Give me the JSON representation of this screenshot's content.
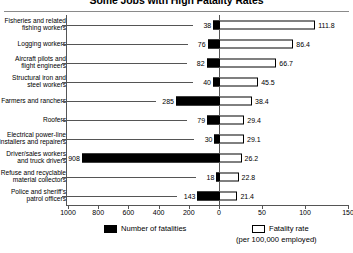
{
  "chart_data": {
    "type": "bar",
    "title": "Some Jobs with High Fatality Rates",
    "orientation": "horizontal",
    "style": "bidirectional",
    "categories": [
      "Fisheries and related\nfishing workers",
      "Logging workers",
      "Aircraft pilots and\nflight engineers",
      "Structural iron and\nsteel workers",
      "Farmers and ranchers",
      "Roofers",
      "Electrical power-line\ninstallers and repairers",
      "Driver/sales workers\nand truck drivers",
      "Refuse and recyclable\nmaterial collectors",
      "Police and sheriff's\npatrol officers"
    ],
    "series": [
      {
        "name": "Number of fatalities",
        "direction": "left",
        "color": "#000000",
        "values": [
          38,
          76,
          82,
          40,
          285,
          79,
          30,
          908,
          18,
          143
        ],
        "axis_range": [
          0,
          1000
        ],
        "axis_ticks": [
          1000,
          800,
          600,
          400,
          200,
          0
        ]
      },
      {
        "name": "Fatality rate (per 100,000 employed)",
        "direction": "right",
        "color": "#ffffff",
        "values": [
          111.8,
          86.4,
          66.7,
          45.5,
          38.4,
          29.4,
          29.1,
          26.2,
          22.8,
          21.4
        ],
        "axis_range": [
          0,
          150
        ],
        "axis_ticks": [
          0,
          50,
          100,
          150
        ]
      }
    ],
    "xlabel": "",
    "ylabel": "",
    "grid": false,
    "legend_position": "bottom"
  },
  "title": "Some Jobs with High Fatality Rates",
  "axis": {
    "tick_labels": [
      "1000",
      "800",
      "600",
      "400",
      "200",
      "0",
      "50",
      "100",
      "150"
    ]
  },
  "legend": {
    "fatalities_label": "Number of fatalities",
    "rate_label": "Fatality rate",
    "rate_sublabel": "(per 100,000 employed)"
  }
}
